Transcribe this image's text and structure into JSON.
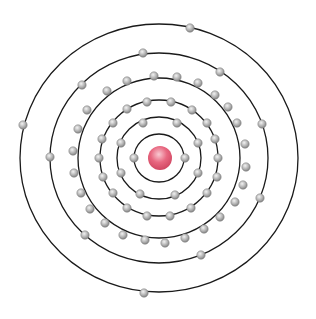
{
  "diagram": {
    "type": "bohr-atom-model",
    "center": [
      159,
      158
    ],
    "nucleus": {
      "radius": 12,
      "color": "#e0506a",
      "highlight": "#f7b8c4"
    },
    "electron": {
      "radius": 4.2,
      "color": "#a8a8a8",
      "edge": "#7a7a7a",
      "highlight": "#eeeeee"
    },
    "shell_color": "#1a1a1a",
    "electron_counts": [
      2,
      8,
      18,
      25,
      8,
      3
    ],
    "shells": [
      {
        "rx": 25,
        "ry": 24,
        "electrons": [
          [
            134,
            158
          ],
          [
            185,
            158
          ]
        ]
      },
      {
        "rx": 42,
        "ry": 41,
        "electrons": [
          [
            143,
            123
          ],
          [
            177,
            123
          ],
          [
            198,
            143
          ],
          [
            198,
            173
          ],
          [
            175,
            195
          ],
          [
            140,
            194
          ],
          [
            121,
            173
          ],
          [
            121,
            143
          ]
        ]
      },
      {
        "rx": 59,
        "ry": 58,
        "electrons": [
          [
            147,
            102
          ],
          [
            171,
            102
          ],
          [
            192,
            110
          ],
          [
            207,
            123
          ],
          [
            215,
            139
          ],
          [
            218,
            158
          ],
          [
            217,
            177
          ],
          [
            207,
            193
          ],
          [
            191,
            208
          ],
          [
            170,
            216
          ],
          [
            147,
            216
          ],
          [
            127,
            208
          ],
          [
            113,
            193
          ],
          [
            103,
            177
          ],
          [
            99,
            158
          ],
          [
            102,
            139
          ],
          [
            113,
            123
          ],
          [
            127,
            109
          ]
        ]
      },
      {
        "rx": 81,
        "ry": 80,
        "electrons": [
          [
            127,
            81
          ],
          [
            154,
            76
          ],
          [
            177,
            77
          ],
          [
            198,
            83
          ],
          [
            215,
            95
          ],
          [
            228,
            107
          ],
          [
            237,
            123
          ],
          [
            245,
            144
          ],
          [
            246,
            167
          ],
          [
            243,
            185
          ],
          [
            235,
            202
          ],
          [
            220,
            217
          ],
          [
            204,
            229
          ],
          [
            185,
            238
          ],
          [
            165,
            243
          ],
          [
            145,
            240
          ],
          [
            123,
            235
          ],
          [
            105,
            223
          ],
          [
            90,
            209
          ],
          [
            81,
            193
          ],
          [
            74,
            173
          ],
          [
            73,
            151
          ],
          [
            78,
            129
          ],
          [
            87,
            110
          ],
          [
            107,
            91
          ]
        ]
      },
      {
        "rx": 109,
        "ry": 105,
        "electrons": [
          [
            143,
            53
          ],
          [
            220,
            72
          ],
          [
            262,
            124
          ],
          [
            260,
            198
          ],
          [
            201,
            255
          ],
          [
            85,
            235
          ],
          [
            50,
            157
          ],
          [
            82,
            85
          ]
        ]
      },
      {
        "rx": 139,
        "ry": 134,
        "electrons": [
          [
            190,
            28
          ],
          [
            23,
            125
          ],
          [
            144,
            293
          ]
        ]
      }
    ]
  }
}
